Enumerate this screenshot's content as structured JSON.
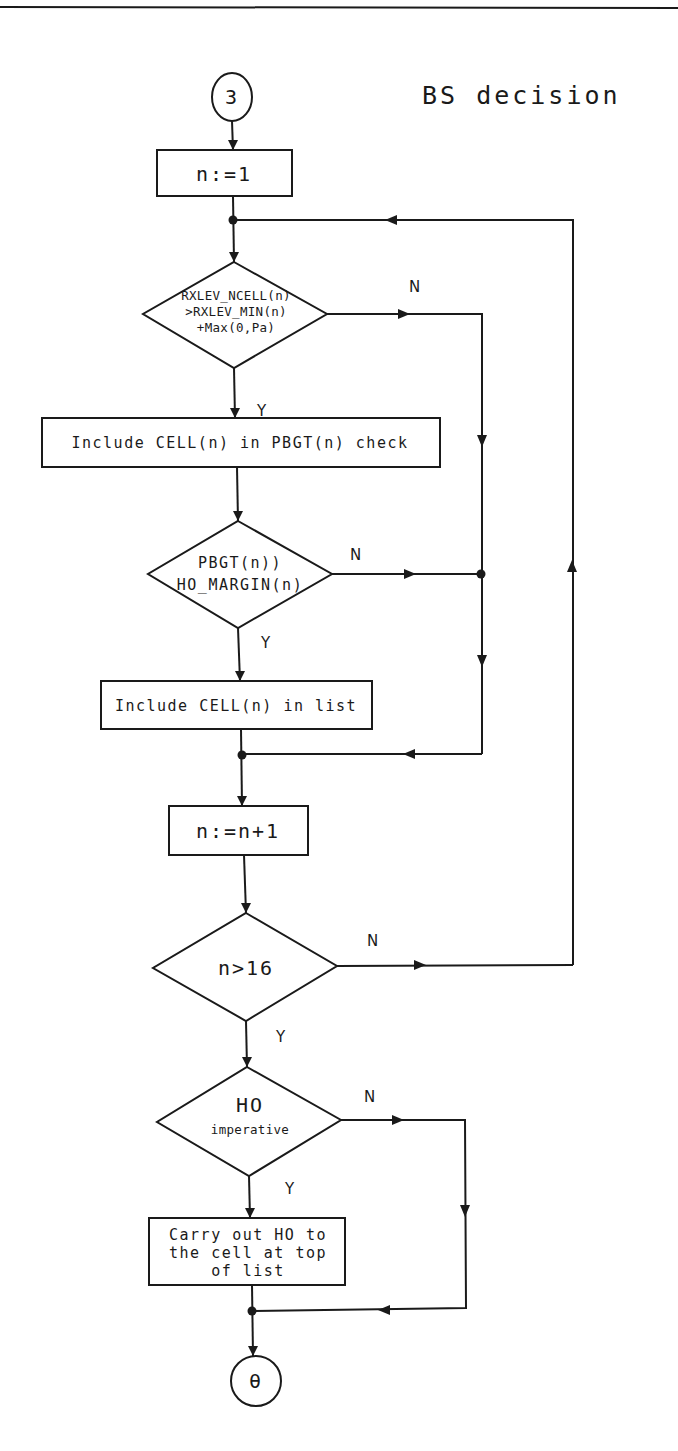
{
  "title": "BS decision",
  "connectors": {
    "entry": "3",
    "exit": "θ"
  },
  "nodes": {
    "init": "n:=1",
    "decision_rxlev": {
      "lines": [
        "RXLEV_NCELL(n)",
        ">RXLEV_MIN(n)",
        "+Max(0,Pa)"
      ],
      "yes": "Y",
      "no": "N"
    },
    "include_pbgt": "Include CELL(n) in PBGT(n) check",
    "decision_pbgt": {
      "lines": [
        "PBGT(n))",
        "HO_MARGIN(n)"
      ],
      "yes": "Y",
      "no": "N"
    },
    "include_list": "Include CELL(n) in list",
    "increment": "n:=n+1",
    "decision_count": {
      "lines": [
        "n>16"
      ],
      "yes": "Y",
      "no": "N"
    },
    "decision_ho": {
      "lines": [
        "HO",
        "imperative"
      ],
      "yes": "Y",
      "no": "N"
    },
    "carry_out": {
      "lines": [
        "Carry out HO to",
        "the cell at top",
        "of list"
      ]
    }
  }
}
